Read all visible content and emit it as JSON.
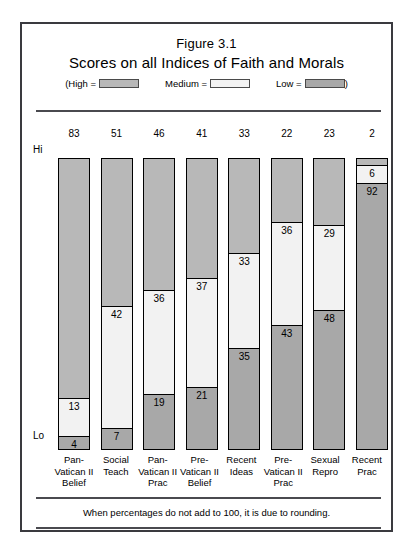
{
  "figure": {
    "number": "Figure 3.1",
    "title": "Scores on all Indices of Faith and Morals"
  },
  "legend": {
    "open_paren": "(High =",
    "medium_label": "Medium =",
    "low_label": "Low =",
    "close_paren": ")",
    "high_color": "#b8b8b8",
    "medium_color": "#f2f2f2",
    "low_color": "#a8a8a8"
  },
  "axis": {
    "high_label": "Hi",
    "low_label": "Lo"
  },
  "footnote": "When percentages do not add to 100, it is due to rounding.",
  "chart_data": {
    "type": "bar",
    "title": "Scores on all Indices of Faith and Morals",
    "subtitle": "Figure 3.1",
    "xlabel": "",
    "ylabel": "",
    "ylim": [
      0,
      100
    ],
    "grid": false,
    "stacked": true,
    "legend_position": "top",
    "legend_entries": [
      "High",
      "Medium",
      "Low"
    ],
    "categories": [
      "Pan-Vatican II Belief",
      "Social Teach",
      "Pan-Vatican II Prac",
      "Pre-Vatican II Belief",
      "Recent Ideas",
      "Pre-Vatican II Prac",
      "Sexual Repro",
      "Recent Prac"
    ],
    "category_lines": [
      [
        "Pan-",
        "Vatican II",
        "Belief"
      ],
      [
        "Social",
        "Teach"
      ],
      [
        "Pan-",
        "Vatican II",
        "Prac"
      ],
      [
        "Pre-",
        "Vatican II",
        "Belief"
      ],
      [
        "Recent",
        "Ideas"
      ],
      [
        "Pre-",
        "Vatican II",
        "Prac"
      ],
      [
        "Sexual",
        "Repro"
      ],
      [
        "Recent",
        "Prac"
      ]
    ],
    "series": [
      {
        "name": "High",
        "values": [
          83,
          51,
          46,
          41,
          33,
          22,
          23,
          2
        ]
      },
      {
        "name": "Medium",
        "values": [
          13,
          42,
          36,
          37,
          33,
          36,
          29,
          6
        ]
      },
      {
        "name": "Low",
        "values": [
          4,
          7,
          19,
          21,
          35,
          43,
          48,
          92
        ]
      }
    ]
  }
}
